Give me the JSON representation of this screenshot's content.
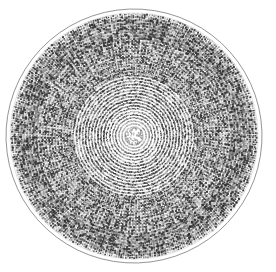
{
  "figure": {
    "title": "Centric diatom valve",
    "view": "valve view",
    "background_color": "#ffffff",
    "canvas": {
      "width": 276,
      "height": 272
    }
  },
  "specimen": {
    "center_x": 134,
    "center_y": 136,
    "radius_x": 128,
    "radius_y": 127,
    "rotation_deg": -2,
    "margin_ring": {
      "label": "valve margin",
      "color": "#8a8a8a",
      "line_width": 1.0,
      "inner_offset": 4
    },
    "hyaline_band": {
      "label": "marginal hyaline band",
      "width": 5,
      "color": "#ffffff"
    },
    "central_area": {
      "label": "central annulus",
      "radius": 9,
      "color": "#c9c9c9"
    },
    "areolae": {
      "label": "areolae",
      "glyph": "square-dot",
      "color_dark": "#2a2a2a",
      "color_mid": "#6e6e6e",
      "color_light": "#a8a8a8",
      "size_min": 0.9,
      "size_max": 1.9,
      "radial_spacing": 3.05,
      "count_approx": 14500
    },
    "striae": {
      "label": "radial striae",
      "count": 168,
      "arrangement": "radial, fasciculate with dichotomous insertion",
      "insertion_radii": [
        30,
        62,
        98
      ]
    }
  },
  "legend": {
    "items": [
      {
        "name": "valve margin",
        "color": "#8a8a8a"
      },
      {
        "name": "radial striae",
        "color": "#4a4a4a"
      },
      {
        "name": "areolae",
        "color": "#2a2a2a"
      },
      {
        "name": "central annulus",
        "color": "#c9c9c9"
      }
    ]
  }
}
